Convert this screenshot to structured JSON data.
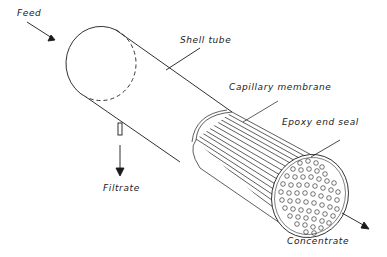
{
  "diagram": {
    "type": "capillary membrane module (isometric cutaway)",
    "colors": {
      "ink": "#1a1a1a",
      "background": "#ffffff"
    },
    "labels": {
      "feed": "Feed",
      "shell_tube": "Shell tube",
      "capillary_membrane": "Capillary  membrane",
      "epoxy_end_seal": "Epoxy end seal",
      "filtrate": "Filtrate",
      "concentrate": "Concentrate"
    },
    "flows": [
      {
        "name": "Feed",
        "direction": "in"
      },
      {
        "name": "Filtrate",
        "direction": "out"
      },
      {
        "name": "Concentrate",
        "direction": "out"
      }
    ]
  }
}
